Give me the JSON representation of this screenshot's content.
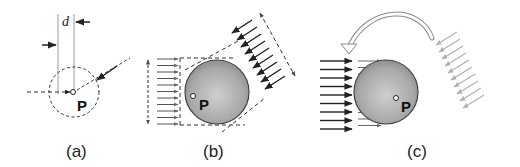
{
  "figure": {
    "panels": [
      {
        "id": "a",
        "label": "(a)",
        "point_label": "P",
        "distance_label": "d"
      },
      {
        "id": "b",
        "label": "(b)",
        "point_label": "P"
      },
      {
        "id": "c",
        "label": "(c)",
        "point_label": "P"
      }
    ],
    "colors": {
      "line": "#222222",
      "guide_line": "#9a9a9a",
      "sphere_light": "#c8c8c8",
      "sphere_dark": "#7a7a7a",
      "light_arrows": "#b0b0b0"
    }
  }
}
